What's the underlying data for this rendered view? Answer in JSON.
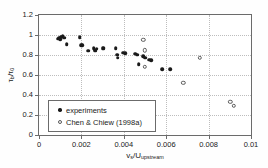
{
  "chart_data": {
    "type": "scatter",
    "title": "",
    "xlabel": "v_s/U_upstream",
    "ylabel": "tau_b/tau_0",
    "xlim": [
      0,
      0.01
    ],
    "ylim": [
      0,
      1.2
    ],
    "xticks": [
      "0",
      "0.002",
      "0.004",
      "0.006",
      "0.008",
      "0.01"
    ],
    "xtick_values": [
      0,
      0.002,
      0.004,
      0.006,
      0.008,
      0.01
    ],
    "yticks": [
      "0",
      "0.2",
      "0.4",
      "0.6",
      "0.8",
      "1",
      "1.2"
    ],
    "ytick_values": [
      0,
      0.2,
      0.4,
      0.6,
      0.8,
      1,
      1.2
    ],
    "grid": "dotted-both",
    "legend_position": "lower-left-inside",
    "series": [
      {
        "name": "experiments",
        "marker": "filled-circle",
        "color": "#1a1a1a",
        "points": [
          [
            0.00088,
            0.965
          ],
          [
            0.00095,
            0.975
          ],
          [
            0.001,
            0.96
          ],
          [
            0.00105,
            0.985
          ],
          [
            0.00112,
            0.99
          ],
          [
            0.00118,
            0.975
          ],
          [
            0.0013,
            0.91
          ],
          [
            0.00192,
            0.98
          ],
          [
            0.00198,
            0.9
          ],
          [
            0.00205,
            0.898
          ],
          [
            0.00232,
            0.845
          ],
          [
            0.00258,
            0.87
          ],
          [
            0.00262,
            0.855
          ],
          [
            0.00266,
            0.845
          ],
          [
            0.00272,
            0.862
          ],
          [
            0.003,
            0.868
          ],
          [
            0.00305,
            0.866
          ],
          [
            0.00362,
            0.87
          ],
          [
            0.00368,
            0.805
          ],
          [
            0.00372,
            0.775
          ],
          [
            0.00398,
            0.822
          ],
          [
            0.00408,
            0.82
          ],
          [
            0.00455,
            0.815
          ],
          [
            0.00462,
            0.805
          ],
          [
            0.0047,
            0.71
          ],
          [
            0.00492,
            0.79
          ],
          [
            0.005,
            0.772
          ],
          [
            0.0052,
            0.755
          ],
          [
            0.0053,
            0.748
          ],
          [
            0.0058,
            0.66
          ],
          [
            0.0062,
            0.658
          ]
        ]
      },
      {
        "name": "Chen & Chiew (1998a)",
        "marker": "open-circle",
        "color": "#5a5a5a",
        "points": [
          [
            0.00492,
            0.952
          ],
          [
            0.00498,
            0.848
          ],
          [
            0.005,
            0.685
          ],
          [
            0.0068,
            0.52
          ],
          [
            0.00758,
            0.775
          ],
          [
            0.00902,
            0.332
          ],
          [
            0.00918,
            0.293
          ]
        ]
      }
    ]
  },
  "legend": {
    "items": [
      {
        "label": "experiments",
        "marker": "filled-circle"
      },
      {
        "label": "Chen & Chiew (1998a)",
        "marker": "open-circle"
      }
    ]
  }
}
